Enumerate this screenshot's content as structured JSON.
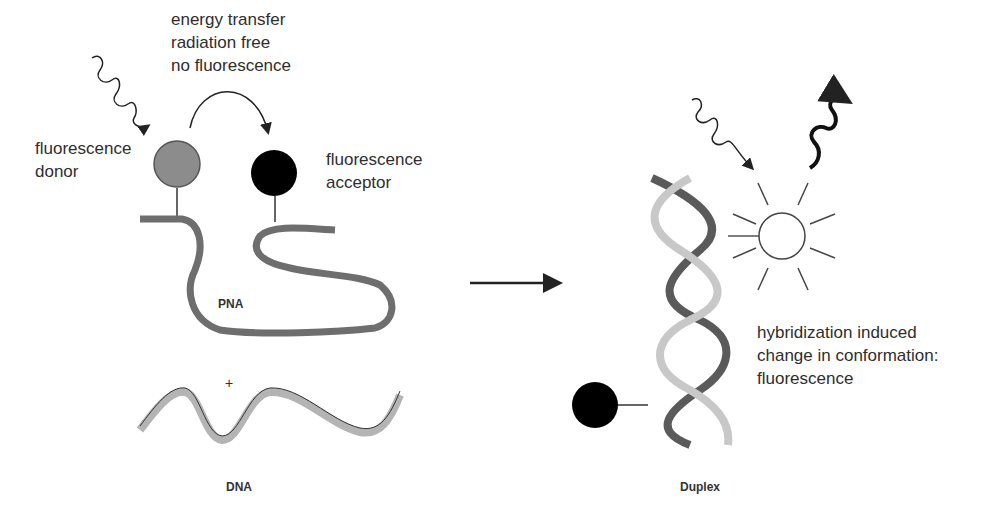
{
  "diagram": {
    "left_panel": {
      "energy_transfer_lines": [
        "energy transfer",
        "radiation free",
        "no fluorescence"
      ],
      "donor_label": [
        "fluorescence",
        "donor"
      ],
      "acceptor_label": [
        "fluorescence",
        "acceptor"
      ],
      "strand_label": "PNA",
      "plus_sign": "+",
      "target_label": "DNA"
    },
    "right_panel": {
      "result_label": [
        "hybridization induced",
        "change in conformation:",
        "fluorescence"
      ],
      "duplex_label": "Duplex"
    },
    "colors": {
      "donor": "#8c8c8c",
      "acceptor": "#000000",
      "pna_ribbon": "#6e6e6e",
      "dna_ribbon": "#b4b4b4",
      "helix_light": "#c8c8c8",
      "helix_dark": "#5a5a5a"
    }
  }
}
